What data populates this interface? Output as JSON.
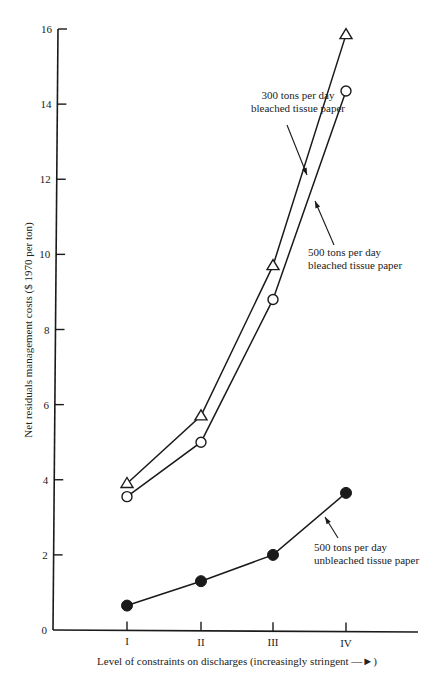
{
  "chart_data": {
    "type": "line",
    "title": "",
    "xlabel": "Level of constraints on discharges (increasingly stringent —►)",
    "ylabel": "Net residuals management costs ($ 1970 per ton)",
    "categories": [
      "I",
      "II",
      "III",
      "IV"
    ],
    "ylim": [
      0,
      16
    ],
    "yticks": [
      0,
      2,
      4,
      6,
      8,
      10,
      12,
      14,
      16
    ],
    "grid": false,
    "legend": "none (inline annotations)",
    "series": [
      {
        "name": "300 tons per day bleached tissue paper",
        "marker": "open-triangle",
        "values": [
          3.9,
          5.7,
          9.7,
          15.85
        ],
        "annotation": [
          "300 tons per day",
          "bleached tissue paper"
        ]
      },
      {
        "name": "500 tons per day bleached tissue paper",
        "marker": "open-circle",
        "values": [
          3.55,
          5.0,
          8.8,
          14.35
        ],
        "annotation": [
          "500 tons per day",
          "bleached tissue paper"
        ]
      },
      {
        "name": "500 tons per day unbleached tissue paper",
        "marker": "filled-circle",
        "values": [
          0.65,
          1.3,
          2.0,
          3.65
        ],
        "annotation": [
          "500 tons per day",
          "unbleached tissue paper"
        ]
      }
    ]
  },
  "colors": {
    "ink": "#1a1a1a",
    "background": "#ffffff"
  }
}
